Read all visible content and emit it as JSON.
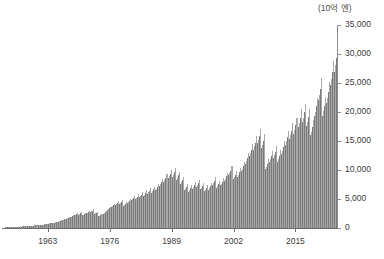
{
  "chart_data": {
    "type": "bar",
    "title": "",
    "subtitle": "",
    "unit_label": "(10억 엔)",
    "xlabel": "",
    "ylabel": "",
    "ylim": [
      0,
      35000
    ],
    "y_ticks": [
      0,
      5000,
      10000,
      15000,
      20000,
      25000,
      30000,
      35000
    ],
    "y_tick_labels": [
      "0",
      "5,000",
      "10,000",
      "15,000",
      "20,000",
      "25,000",
      "30,000",
      "35,000"
    ],
    "x_ticks": [
      1963,
      1976,
      1989,
      2002,
      2015
    ],
    "x_tick_labels": [
      "1963",
      "1976",
      "1989",
      "2002",
      "2015"
    ],
    "x_range": [
      1954,
      2023.75
    ],
    "grid": false,
    "legend": "none",
    "series_note": "quarterly values, alternating light/dark shading by quarter",
    "bar_colors": {
      "dark": "#7a7a7a",
      "light": "#a9a9a9"
    },
    "frequency": "quarterly",
    "start_year": 1954,
    "start_quarter": 1,
    "values": [
      120,
      130,
      140,
      150,
      150,
      160,
      170,
      185,
      185,
      195,
      205,
      225,
      225,
      235,
      250,
      270,
      255,
      265,
      280,
      300,
      290,
      300,
      320,
      345,
      350,
      365,
      385,
      415,
      420,
      440,
      465,
      500,
      480,
      500,
      525,
      565,
      560,
      585,
      615,
      660,
      680,
      710,
      745,
      800,
      790,
      820,
      860,
      925,
      930,
      970,
      1015,
      1090,
      1120,
      1165,
      1220,
      1310,
      1380,
      1435,
      1505,
      1615,
      1630,
      1695,
      1775,
      1905,
      1860,
      1935,
      2025,
      2175,
      2180,
      2265,
      2370,
      2545,
      2310,
      2400,
      2515,
      2700,
      2160,
      2245,
      2350,
      2525,
      2540,
      2640,
      2765,
      2970,
      2760,
      2870,
      3005,
      3225,
      2420,
      2515,
      2635,
      2830,
      2030,
      2110,
      2210,
      2370,
      2460,
      2560,
      2680,
      2875,
      3120,
      3245,
      3400,
      3650,
      3580,
      3725,
      3900,
      4190,
      4020,
      4180,
      4380,
      4700,
      4100,
      4260,
      4460,
      4790,
      3880,
      4035,
      4225,
      4535,
      4260,
      4430,
      4640,
      4980,
      4760,
      4950,
      5180,
      5565,
      4980,
      5180,
      5425,
      5820,
      5300,
      5510,
      5770,
      6195,
      5540,
      5760,
      6030,
      6475,
      5890,
      6125,
      6415,
      6885,
      6120,
      6365,
      6665,
      7155,
      6540,
      6800,
      7120,
      7645,
      7260,
      7550,
      7905,
      8485,
      7980,
      8300,
      8690,
      9330,
      8620,
      8960,
      9385,
      10075,
      8820,
      9170,
      9600,
      10310,
      8320,
      8650,
      9055,
      9720,
      7580,
      7880,
      8255,
      8860,
      6480,
      6740,
      7055,
      7575,
      6280,
      6530,
      6840,
      7340,
      6760,
      7030,
      7360,
      7900,
      7120,
      7405,
      7755,
      8325,
      6680,
      6945,
      7275,
      7810,
      6320,
      6570,
      6880,
      7390,
      6620,
      6885,
      7210,
      7740,
      7480,
      7780,
      8145,
      8745,
      6980,
      7260,
      7600,
      8160,
      7340,
      7635,
      7995,
      8580,
      8160,
      8485,
      8885,
      9540,
      9100,
      9465,
      9910,
      10640,
      8440,
      8780,
      9195,
      9870,
      8860,
      9215,
      9650,
      10360,
      9780,
      10170,
      10650,
      11430,
      11060,
      11500,
      12040,
      12925,
      12340,
      12835,
      13440,
      14430,
      13520,
      14060,
      14720,
      15805,
      14620,
      15205,
      15920,
      17090,
      13800,
      14350,
      15025,
      16130,
      10180,
      10585,
      11085,
      11900,
      11420,
      11875,
      12435,
      13350,
      12060,
      12540,
      13130,
      14095,
      11460,
      11920,
      12480,
      13400,
      12840,
      13355,
      13985,
      15015,
      14380,
      14955,
      15660,
      16810,
      15420,
      16035,
      16790,
      18025,
      16260,
      16910,
      17705,
      19005,
      17480,
      18180,
      19035,
      20435,
      18320,
      19050,
      19950,
      21415,
      17620,
      18325,
      19190,
      20600,
      15960,
      16600,
      17380,
      18660,
      19240,
      20010,
      20955,
      22500,
      22080,
      22960,
      24045,
      25815,
      19340,
      20115,
      21065,
      22615,
      21560,
      22425,
      23480,
      25205,
      24680,
      25670,
      26880,
      28855,
      26940,
      28020,
      29340,
      31500
    ]
  },
  "caption_sliver": ""
}
